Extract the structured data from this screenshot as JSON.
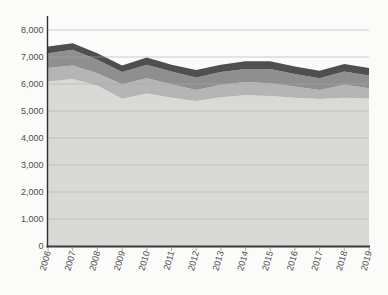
{
  "chart_data": {
    "type": "area",
    "stacked": true,
    "title": "",
    "xlabel": "",
    "ylabel": "",
    "ylim": [
      0,
      8000
    ],
    "grid": true,
    "legend": "none",
    "categories": [
      "2006",
      "2007",
      "2008",
      "2009",
      "2010",
      "2011",
      "2012",
      "2013",
      "2014",
      "2015",
      "2016",
      "2017",
      "2018",
      "2019"
    ],
    "y_tick_labels": [
      "0",
      "1,000",
      "2,000",
      "3,000",
      "4,000",
      "5,000",
      "6,000",
      "7,000",
      "8,000"
    ],
    "series": [
      {
        "name": "layer-1-bottom-lightest",
        "color": "#d9d9d6",
        "values": [
          6090,
          6190,
          5940,
          5450,
          5650,
          5490,
          5370,
          5510,
          5580,
          5560,
          5490,
          5440,
          5490,
          5460
        ]
      },
      {
        "name": "layer-2",
        "color": "#b5b5b5",
        "values": [
          500,
          500,
          460,
          540,
          560,
          500,
          410,
          460,
          490,
          470,
          420,
          340,
          480,
          380
        ]
      },
      {
        "name": "layer-3",
        "color": "#8f8f8f",
        "values": [
          550,
          580,
          500,
          450,
          500,
          470,
          460,
          470,
          490,
          530,
          460,
          430,
          490,
          470
        ]
      },
      {
        "name": "layer-4-top-darkest",
        "color": "#4f4f4f",
        "values": [
          250,
          240,
          240,
          250,
          270,
          250,
          280,
          270,
          280,
          280,
          280,
          280,
          280,
          280
        ]
      }
    ],
    "totals": [
      7390,
      7510,
      7140,
      6690,
      6980,
      6710,
      6520,
      6710,
      6840,
      6840,
      6650,
      6490,
      6740,
      6590
    ]
  },
  "style": {
    "background": "#fbfbfa",
    "gridline_color": "#ababab",
    "axis_color": "#2e2e2e",
    "bottom_axis_color": "#3a3a3a",
    "tick_color": "#9a9a9a",
    "tick_label_color": "#4d4d4d"
  }
}
